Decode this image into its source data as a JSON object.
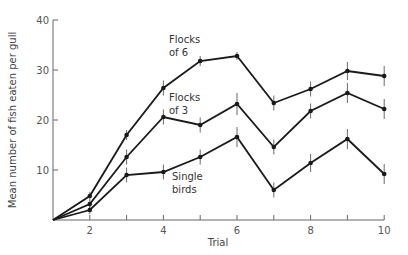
{
  "chart_data": {
    "type": "line",
    "title": "",
    "xlabel": "Trial",
    "ylabel": "Mean number of fish eaten per gull",
    "x": [
      1,
      2,
      3,
      4,
      5,
      6,
      7,
      8,
      9,
      10
    ],
    "xticks": [
      2,
      4,
      6,
      8,
      10
    ],
    "yticks": [
      10,
      20,
      30,
      40
    ],
    "xlim": [
      1,
      10
    ],
    "ylim": [
      0,
      40
    ],
    "grid": false,
    "legend": "inline labels",
    "series": [
      {
        "name": "Flocks of 6",
        "label_lines": [
          "Flocks",
          "of 6"
        ],
        "values": [
          0,
          4.8,
          17,
          26.4,
          31.8,
          32.8,
          23.4,
          26.2,
          29.8,
          28.8
        ],
        "errors": [
          0,
          0.8,
          1,
          1.5,
          1,
          0.8,
          1.5,
          1.5,
          1.8,
          2
        ]
      },
      {
        "name": "Flocks of 3",
        "label_lines": [
          "Flocks",
          "of 3"
        ],
        "values": [
          0,
          3.2,
          12.6,
          20.6,
          19,
          23.2,
          14.6,
          21.8,
          25.4,
          22.2
        ],
        "errors": [
          0,
          0.8,
          1.5,
          1.5,
          1.5,
          2.2,
          1.5,
          1.5,
          2,
          2
        ]
      },
      {
        "name": "Single birds",
        "label_lines": [
          "Single",
          "birds"
        ],
        "values": [
          0,
          2,
          9,
          9.6,
          12.6,
          16.6,
          6,
          11.4,
          16.2,
          9.2
        ],
        "errors": [
          0,
          0.8,
          1.5,
          1.5,
          1.5,
          2,
          1.5,
          1.8,
          2,
          2
        ]
      }
    ],
    "colors": {
      "line": "#1a1a1a",
      "axis": "#666666",
      "errorbar": "#444444"
    }
  }
}
